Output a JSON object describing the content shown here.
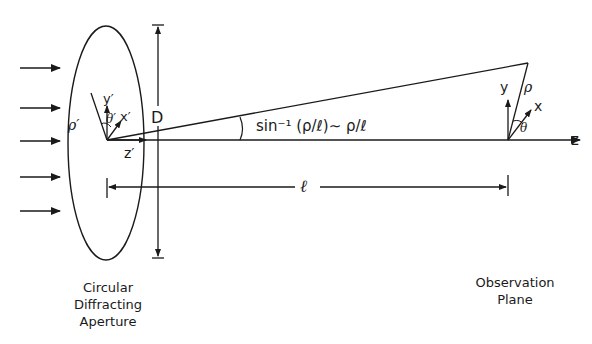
{
  "diagram": {
    "aperture": {
      "caption": [
        "Circular",
        "Diffracting",
        "Aperture"
      ],
      "labels": {
        "rho_prime": "ρ′",
        "y_prime": "y′",
        "x_prime": "x′",
        "theta_prime": "θ′",
        "z_prime": "z′",
        "diameter": "D"
      }
    },
    "observation": {
      "caption": [
        "Observation",
        "Plane"
      ],
      "labels": {
        "y": "y",
        "x": "x",
        "rho": "ρ",
        "theta": "θ",
        "z": "z"
      }
    },
    "angle_label": "sin⁻¹ (ρ/ℓ)∼ ρ/ℓ",
    "distance_label": "ℓ",
    "incident_arrows_count": 5,
    "colors": {
      "ink": "#1a1a1a",
      "background": "#ffffff"
    }
  }
}
